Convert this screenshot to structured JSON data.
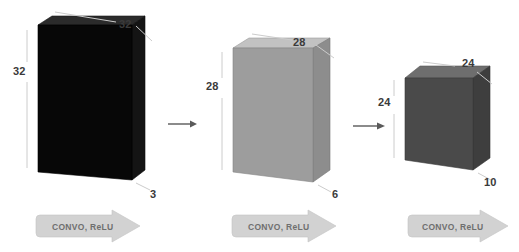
{
  "diagram": {
    "colors": {
      "block1_front": "#0a0a0a",
      "block1_top": "#2b2b2b",
      "block1_side": "#151515",
      "block2_front": "#9a9a9a",
      "block2_top": "#c0c0c0",
      "block2_side": "#8a8a8a",
      "block3_front": "#4a4a4a",
      "block3_top": "#6e6e6e",
      "block3_side": "#3d3d3d",
      "banner_fill": "#d0d0d0",
      "banner_text": "#6f6f6f",
      "label_text": "#3a3a3a",
      "leader_line": "#c9c9c9",
      "arrow": "#5a5a5a",
      "background": "#ffffff"
    },
    "blocks": [
      {
        "id": "input-volume",
        "name": "input-volume-block",
        "height_label": "32",
        "width_label": "32",
        "depth_label": "3"
      },
      {
        "id": "conv1-volume",
        "name": "conv1-volume-block",
        "height_label": "28",
        "width_label": "28",
        "depth_label": "6"
      },
      {
        "id": "conv2-volume",
        "name": "conv2-volume-block",
        "height_label": "24",
        "width_label": "24",
        "depth_label": "10"
      }
    ],
    "operations": [
      {
        "id": "op1",
        "label": "CONVO, ReLU"
      },
      {
        "id": "op2",
        "label": "CONVO, ReLU"
      },
      {
        "id": "op3",
        "label": "CONVO, ReLU"
      }
    ],
    "flow_arrows": [
      {
        "id": "flow1"
      },
      {
        "id": "flow2"
      }
    ]
  }
}
